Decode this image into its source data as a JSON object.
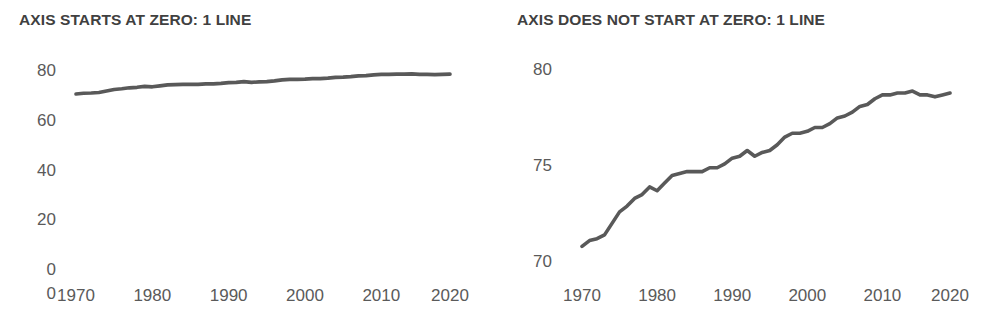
{
  "figure": {
    "background": "#ffffff",
    "line_color": "#595959",
    "text_color": "#5a5a5a",
    "title_color": "#404040"
  },
  "panels": {
    "left": {
      "title": "AXIS STARTS AT ZERO: 1 LINE",
      "y_ticks": [
        "80",
        "60",
        "40",
        "20",
        "0"
      ],
      "baseline_label": "0",
      "x_ticks": [
        "1970",
        "1980",
        "1990",
        "2000",
        "2010",
        "2020"
      ]
    },
    "right": {
      "title": "AXIS DOES NOT START AT ZERO: 1 LINE",
      "y_ticks": [
        "80",
        "75",
        "70"
      ],
      "x_ticks": [
        "1970",
        "1980",
        "1990",
        "2000",
        "2010",
        "2020"
      ]
    }
  },
  "chart_data": [
    {
      "type": "line",
      "title": "AXIS STARTS AT ZERO: 1 LINE",
      "xlabel": "",
      "ylabel": "",
      "xlim": [
        1970,
        2019
      ],
      "ylim": [
        0,
        85
      ],
      "ytick_values": [
        80,
        60,
        40,
        20,
        0
      ],
      "xtick_values": [
        1970,
        1980,
        1990,
        2000,
        2010,
        2020
      ],
      "grid": false,
      "legend": "none",
      "axis_starts_at_zero": true,
      "series": [
        {
          "name": "Life expectancy",
          "x": [
            1970,
            1971,
            1972,
            1973,
            1974,
            1975,
            1976,
            1977,
            1978,
            1979,
            1980,
            1981,
            1982,
            1983,
            1984,
            1985,
            1986,
            1987,
            1988,
            1989,
            1990,
            1991,
            1992,
            1993,
            1994,
            1995,
            1996,
            1997,
            1998,
            1999,
            2000,
            2001,
            2002,
            2003,
            2004,
            2005,
            2006,
            2007,
            2008,
            2009,
            2010,
            2011,
            2012,
            2013,
            2014,
            2015,
            2016,
            2017,
            2018,
            2019
          ],
          "values": [
            70.8,
            71.1,
            71.2,
            71.4,
            72.0,
            72.6,
            72.9,
            73.3,
            73.5,
            73.9,
            73.7,
            74.1,
            74.5,
            74.6,
            74.7,
            74.7,
            74.7,
            74.9,
            74.9,
            75.1,
            75.4,
            75.5,
            75.8,
            75.5,
            75.7,
            75.8,
            76.1,
            76.5,
            76.7,
            76.7,
            76.8,
            77.0,
            77.0,
            77.2,
            77.5,
            77.6,
            77.8,
            78.1,
            78.2,
            78.5,
            78.7,
            78.7,
            78.8,
            78.8,
            78.9,
            78.7,
            78.7,
            78.6,
            78.7,
            78.8
          ]
        }
      ]
    },
    {
      "type": "line",
      "title": "AXIS DOES NOT START AT ZERO: 1 LINE",
      "xlabel": "",
      "ylabel": "",
      "xlim": [
        1970,
        2019
      ],
      "ylim": [
        69.4,
        80.6
      ],
      "ytick_values": [
        80,
        75,
        70
      ],
      "xtick_values": [
        1970,
        1980,
        1990,
        2000,
        2010,
        2020
      ],
      "grid": false,
      "legend": "none",
      "axis_starts_at_zero": false,
      "series": [
        {
          "name": "Life expectancy",
          "x": [
            1970,
            1971,
            1972,
            1973,
            1974,
            1975,
            1976,
            1977,
            1978,
            1979,
            1980,
            1981,
            1982,
            1983,
            1984,
            1985,
            1986,
            1987,
            1988,
            1989,
            1990,
            1991,
            1992,
            1993,
            1994,
            1995,
            1996,
            1997,
            1998,
            1999,
            2000,
            2001,
            2002,
            2003,
            2004,
            2005,
            2006,
            2007,
            2008,
            2009,
            2010,
            2011,
            2012,
            2013,
            2014,
            2015,
            2016,
            2017,
            2018,
            2019
          ],
          "values": [
            70.8,
            71.1,
            71.2,
            71.4,
            72.0,
            72.6,
            72.9,
            73.3,
            73.5,
            73.9,
            73.7,
            74.1,
            74.5,
            74.6,
            74.7,
            74.7,
            74.7,
            74.9,
            74.9,
            75.1,
            75.4,
            75.5,
            75.8,
            75.5,
            75.7,
            75.8,
            76.1,
            76.5,
            76.7,
            76.7,
            76.8,
            77.0,
            77.0,
            77.2,
            77.5,
            77.6,
            77.8,
            78.1,
            78.2,
            78.5,
            78.7,
            78.7,
            78.8,
            78.8,
            78.9,
            78.7,
            78.7,
            78.6,
            78.7,
            78.8
          ]
        }
      ]
    }
  ]
}
